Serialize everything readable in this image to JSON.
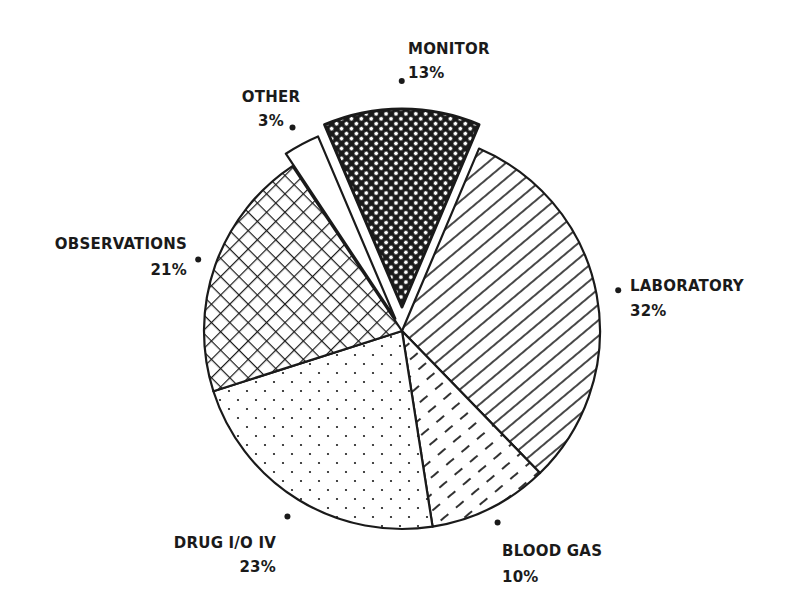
{
  "chart_data": {
    "type": "pie",
    "title": "",
    "start_angle_deg": -23,
    "direction": "clockwise",
    "slices": [
      {
        "label": "MONITOR",
        "value": 13,
        "pct_label": "13%",
        "pattern": "dense-crosshatch",
        "exploded": true
      },
      {
        "label": "LABORATORY",
        "value": 32,
        "pct_label": "32%",
        "pattern": "diagonal-lines",
        "exploded": false
      },
      {
        "label": "BLOOD GAS",
        "value": 10,
        "pct_label": "10%",
        "pattern": "dashed-diagonal",
        "exploded": false
      },
      {
        "label": "DRUG I/O IV",
        "value": 23,
        "pct_label": "23%",
        "pattern": "dots",
        "exploded": false
      },
      {
        "label": "OBSERVATIONS",
        "value": 21,
        "pct_label": "21%",
        "pattern": "crosshatch",
        "exploded": false
      },
      {
        "label": "OTHER",
        "value": 3,
        "pct_label": "3%",
        "pattern": "blank",
        "exploded": true
      }
    ],
    "colors": {
      "ink": "#1a1a1a",
      "background": "#ffffff"
    }
  }
}
